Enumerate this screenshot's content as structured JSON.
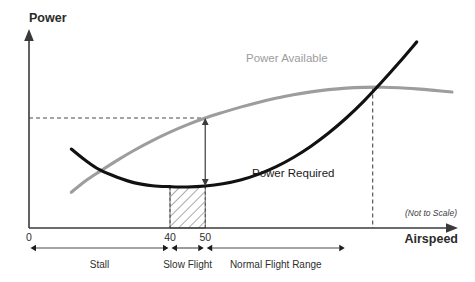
{
  "chart_data": {
    "type": "line",
    "title": "",
    "subtitle": "",
    "xlabel": "Airspeed",
    "ylabel": "Power",
    "note": "(Not to Scale)",
    "grid": false,
    "legend_position": "inline-curve-labels",
    "xlim": [
      0,
      120
    ],
    "ylim": [
      0,
      100
    ],
    "x_ticks": [
      "0",
      "40",
      "50"
    ],
    "x_tick_values": [
      0,
      40,
      50
    ],
    "y_ticks": [],
    "series": [
      {
        "name": "Power Required",
        "color": "#111111",
        "label_x": 62,
        "label_y": 28,
        "x": [
          12,
          16,
          20,
          25,
          30,
          35,
          40,
          45,
          50,
          55,
          60,
          65,
          70,
          75,
          80,
          85,
          90,
          95,
          100,
          105,
          110
        ],
        "y": [
          42,
          36,
          31,
          27,
          24,
          22.5,
          22,
          21.8,
          22.3,
          23.5,
          25.5,
          28.5,
          32.5,
          37.5,
          43.5,
          50.5,
          58.5,
          67.5,
          77.5,
          88,
          99
        ]
      },
      {
        "name": "Power Available",
        "color": "#9d9d9d",
        "label_x": 52,
        "label_y": 84,
        "x": [
          12,
          16,
          20,
          25,
          30,
          35,
          40,
          45,
          50,
          55,
          60,
          65,
          70,
          75,
          80,
          85,
          90,
          95,
          100,
          105,
          110,
          115,
          120
        ],
        "y": [
          19,
          25,
          30,
          36,
          41.5,
          46.5,
          51,
          55,
          58.5,
          61.5,
          64.3,
          66.8,
          69,
          70.9,
          72.4,
          73.6,
          74.4,
          74.8,
          74.9,
          74.6,
          74.0,
          73.2,
          72.3
        ]
      }
    ],
    "annotations": {
      "excess_power_measure": {
        "label": "excess-power-double-arrow",
        "at_x": 50,
        "from_y": 22.3,
        "to_y": 58.5
      },
      "power_available_guide": {
        "label": "horizontal-dashed-guide",
        "y": 58.5,
        "from_x": 0,
        "to_x": 50
      },
      "intersection_guide": {
        "label": "max-speed-dashed-guide",
        "x": 97.5,
        "from_y": 0,
        "to_y": 74.8
      },
      "hatched_region": {
        "label": "region-of-reversed-command",
        "from_x": 40,
        "to_x": 50
      }
    },
    "ranges": [
      {
        "label": "Stall",
        "from_value": 0,
        "to_value": 40
      },
      {
        "label": "Slow Flight",
        "from_value": 40,
        "to_value": 50
      },
      {
        "label": "Normal Flight Range",
        "from_value": 50,
        "to_value": 90
      }
    ]
  },
  "colors": {
    "power_required": "#111111",
    "power_available": "#9d9d9d",
    "axis": "#3a3a3a",
    "background": "#ffffff"
  }
}
